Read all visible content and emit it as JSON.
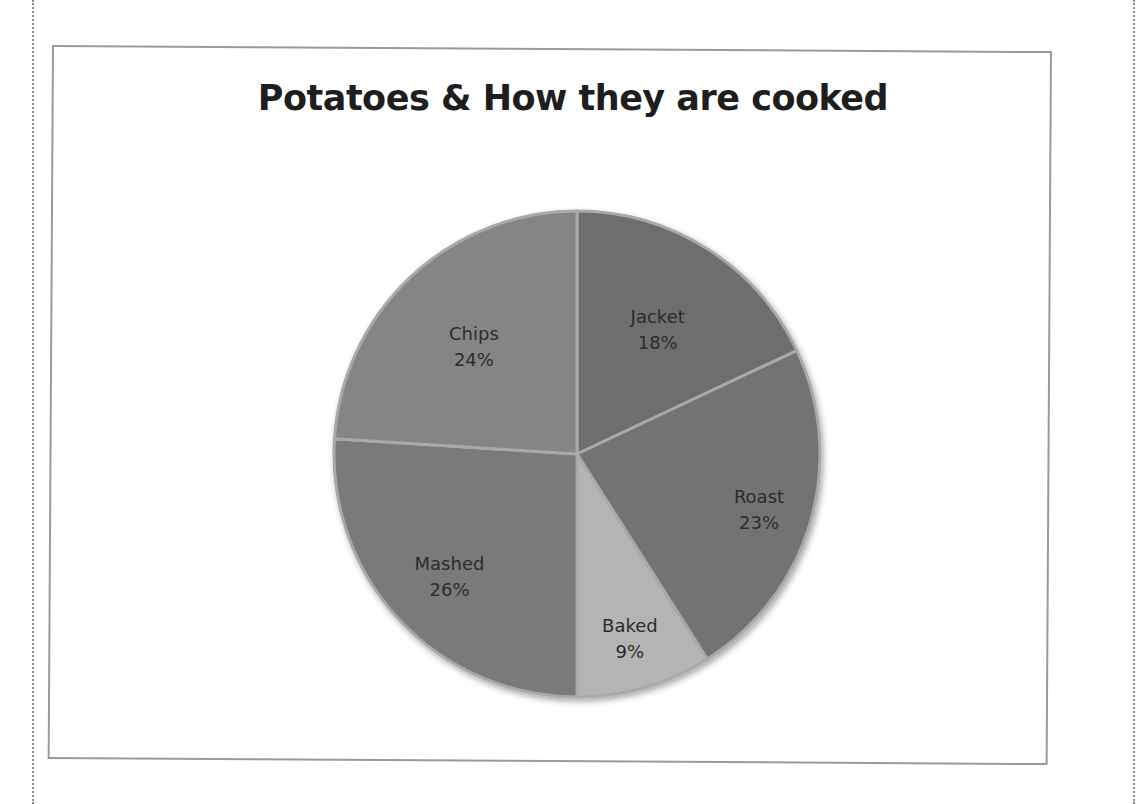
{
  "chart_data": {
    "type": "pie",
    "title": "Potatoes & How they are cooked",
    "categories": [
      "Jacket",
      "Roast",
      "Baked",
      "Mashed",
      "Chips"
    ],
    "values": [
      18,
      23,
      9,
      26,
      24
    ],
    "unit": "%",
    "labels": [
      {
        "name": "Jacket",
        "pct": "18%"
      },
      {
        "name": "Roast",
        "pct": "23%"
      },
      {
        "name": "Baked",
        "pct": "9%"
      },
      {
        "name": "Mashed",
        "pct": "26%"
      },
      {
        "name": "Chips",
        "pct": "24%"
      }
    ],
    "start_angle": "12 o'clock, clockwise",
    "legend": "none (data labels inside slices)",
    "colors": [
      "#6e6e6e",
      "#737373",
      "#b4b4b4",
      "#7a7a7a",
      "#858585"
    ]
  }
}
